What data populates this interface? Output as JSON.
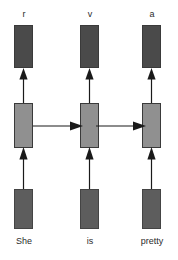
{
  "figure": {
    "colors": {
      "output_box": "#4a4a4a",
      "hidden_box": "#909090",
      "input_box": "#5d5d5d",
      "arrow": "#1a1a1a",
      "text": "#2b2b2b",
      "background": "#ffffff"
    }
  },
  "columns": [
    {
      "output_label": "r",
      "word_label": "She",
      "output_box_name": "output-state-box",
      "hidden_box_name": "hidden-state-box",
      "input_box_name": "input-embedding-box"
    },
    {
      "output_label": "v",
      "word_label": "is",
      "output_box_name": "output-state-box",
      "hidden_box_name": "hidden-state-box",
      "input_box_name": "input-embedding-box"
    },
    {
      "output_label": "a",
      "word_label": "pretty",
      "output_box_name": "output-state-box",
      "hidden_box_name": "hidden-state-box",
      "input_box_name": "input-embedding-box"
    }
  ],
  "recurrent_connections": [
    {
      "from": "She",
      "to": "is"
    },
    {
      "from": "is",
      "to": "pretty"
    }
  ]
}
